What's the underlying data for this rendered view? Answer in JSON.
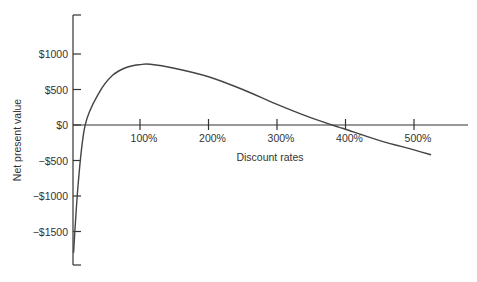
{
  "chart_data": {
    "type": "line",
    "title": "",
    "xlabel": "Discount rates",
    "ylabel": "Net present value",
    "x_ticks": [
      "100%",
      "200%",
      "300%",
      "400%",
      "500%"
    ],
    "y_ticks": [
      "$1000",
      "$500",
      "$0",
      "−$500",
      "−$1000",
      "−$1500"
    ],
    "xlim": [
      0,
      550
    ],
    "ylim": [
      -1800,
      1500
    ],
    "grid": false,
    "legend": null,
    "series": [
      {
        "name": "NPV",
        "x": [
          3,
          10,
          20,
          40,
          60,
          80,
          100,
          115,
          150,
          200,
          250,
          300,
          350,
          390,
          400,
          450,
          500,
          525
        ],
        "y": [
          -1800,
          -800,
          0,
          450,
          700,
          810,
          850,
          855,
          800,
          680,
          500,
          290,
          100,
          -30,
          -60,
          -220,
          -350,
          -420
        ]
      }
    ]
  }
}
